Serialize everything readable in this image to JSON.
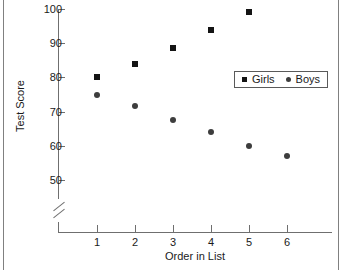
{
  "chart_data": {
    "type": "scatter",
    "title": "",
    "xlabel": "Order in List",
    "ylabel": "Test Score",
    "categories": [
      "1",
      "2",
      "3",
      "4",
      "5",
      "6"
    ],
    "x": [
      1,
      2,
      3,
      4,
      5,
      6
    ],
    "xlim": [
      0.5,
      7.2
    ],
    "ylim": [
      45,
      100
    ],
    "y_axis_break": true,
    "grid": false,
    "legend_position": "inside-upper-right",
    "xticks": [
      "1",
      "2",
      "3",
      "4",
      "5",
      "6"
    ],
    "yticks": [
      "50",
      "60",
      "70",
      "80",
      "90",
      "100"
    ],
    "series": [
      {
        "name": "Girls",
        "marker": "square",
        "color": "#141414",
        "x": [
          1,
          2,
          3,
          4,
          5
        ],
        "values": [
          80,
          84,
          88.5,
          94,
          99
        ]
      },
      {
        "name": "Boys",
        "marker": "circle",
        "color": "#3d3d3d",
        "x": [
          1,
          2,
          3,
          4,
          5,
          6
        ],
        "values": [
          75,
          71.5,
          67.5,
          64,
          60,
          57
        ]
      }
    ]
  },
  "axes": {
    "y_title": "Test Score",
    "x_title": "Order in List",
    "y_ticks": [
      {
        "label": "100",
        "value": 100
      },
      {
        "label": "90",
        "value": 90
      },
      {
        "label": "80",
        "value": 80
      },
      {
        "label": "70",
        "value": 70
      },
      {
        "label": "60",
        "value": 60
      },
      {
        "label": "50",
        "value": 50
      }
    ],
    "x_ticks": [
      {
        "label": "1",
        "value": 1
      },
      {
        "label": "2",
        "value": 2
      },
      {
        "label": "3",
        "value": 3
      },
      {
        "label": "4",
        "value": 4
      },
      {
        "label": "5",
        "value": 5
      },
      {
        "label": "6",
        "value": 6
      }
    ]
  },
  "legend": {
    "entries": [
      {
        "label": "Girls",
        "marker": "square"
      },
      {
        "label": "Boys",
        "marker": "circle"
      }
    ]
  },
  "colors": {
    "girls_marker": "#141414",
    "boys_marker": "#3d3d3d",
    "axis": "#6f6f6f",
    "text": "#1a1a1a",
    "frame": "#808080",
    "background": "#ffffff"
  }
}
